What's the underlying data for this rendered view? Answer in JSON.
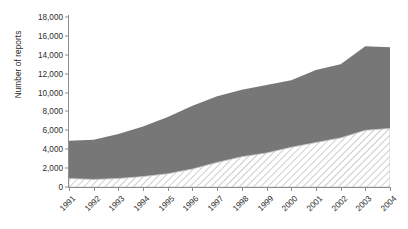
{
  "chart_data": {
    "type": "area",
    "title": "",
    "xlabel": "",
    "ylabel": "Number of reports",
    "categories": [
      "1991",
      "1992",
      "1993",
      "1994",
      "1995",
      "1996",
      "1997",
      "1998",
      "1999",
      "2000",
      "2001",
      "2002",
      "2003",
      "2004"
    ],
    "ylim": [
      0,
      18000
    ],
    "yticks": [
      "0",
      "2,000",
      "4,000",
      "6,000",
      "8,000",
      "10,000",
      "12,000",
      "14,000",
      "16,000",
      "18,000"
    ],
    "ytick_values": [
      0,
      2000,
      4000,
      6000,
      8000,
      10000,
      12000,
      14000,
      16000,
      18000
    ],
    "grid": false,
    "legend": "none",
    "stacked_bands": true,
    "series": [
      {
        "name": "upper-dark-band-top",
        "fill": "#777777",
        "pattern": "solid",
        "values": [
          4900,
          5000,
          5600,
          6400,
          7400,
          8600,
          9600,
          10300,
          10800,
          11300,
          12400,
          13000,
          14900,
          14800
        ]
      },
      {
        "name": "lower-hatched-band-top",
        "fill": "#d9d9d9",
        "pattern": "diagonal-hatch",
        "values": [
          900,
          800,
          900,
          1100,
          1400,
          1900,
          2600,
          3200,
          3600,
          4200,
          4700,
          5200,
          6000,
          6200
        ]
      }
    ],
    "colors": {
      "dark_band": "#777777",
      "hatch_line": "#b8b8b8",
      "hatch_bg": "#ffffff",
      "axis": "#8d8d8d",
      "text": "#2c2c2c",
      "background": "#ffffff"
    }
  }
}
